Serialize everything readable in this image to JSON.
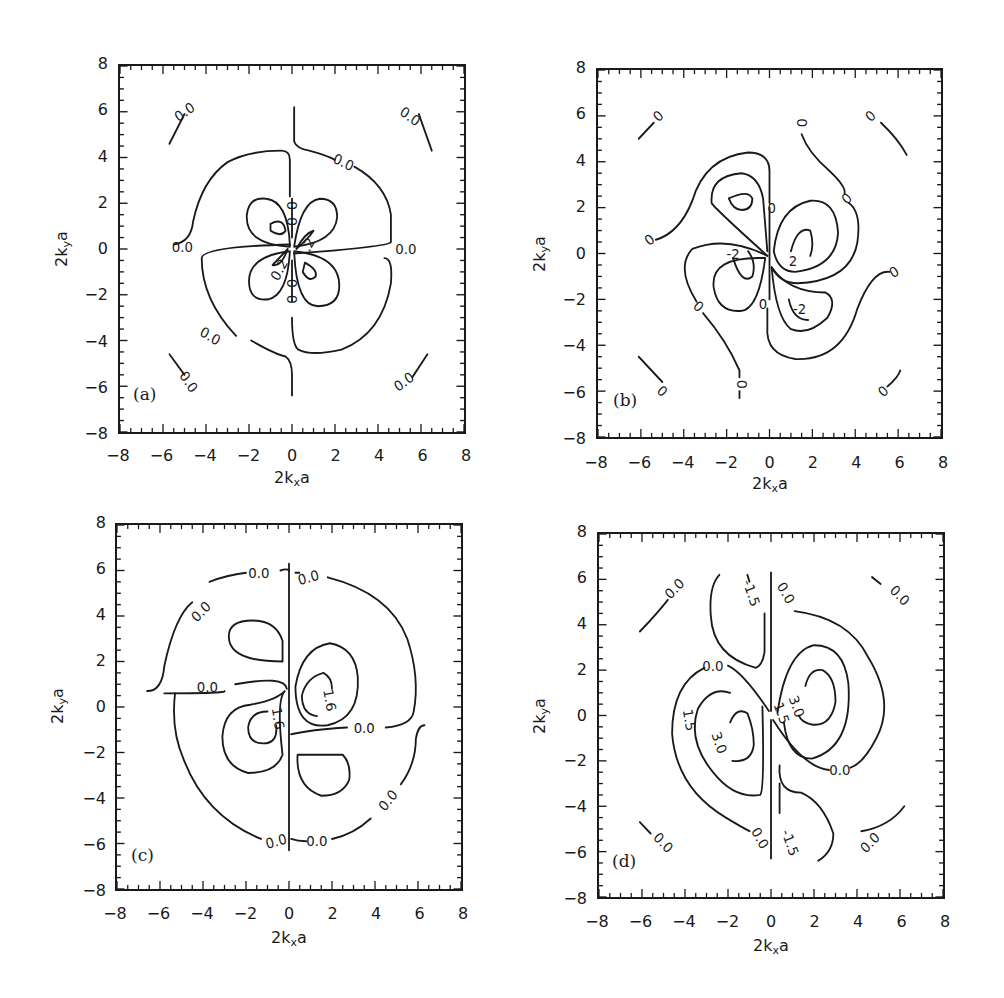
{
  "figure": {
    "axis": {
      "xlabel_main": "2k",
      "xlabel_sub": "x",
      "xlabel_tail": "a",
      "ylabel_main": "2k",
      "ylabel_sub": "y",
      "ylabel_tail": "a",
      "ticks": [
        "-8",
        "-6",
        "-4",
        "-2",
        "0",
        "2",
        "4",
        "6",
        "8"
      ]
    },
    "line_color": "#1a1a1a",
    "background": "#ffffff"
  },
  "chart_data": [
    {
      "type": "contour",
      "panel": "(a)",
      "title": "",
      "xlabel": "2k_x a",
      "ylabel": "2k_y a",
      "xlim": [
        -8,
        8
      ],
      "ylim": [
        -8,
        8
      ],
      "xticks": [
        -8,
        -6,
        -4,
        -2,
        0,
        2,
        4,
        6,
        8
      ],
      "yticks": [
        -8,
        -6,
        -4,
        -2,
        0,
        2,
        4,
        6,
        8
      ],
      "contour_levels": [
        -0.2,
        0.0,
        0.2
      ],
      "contour_labels": [
        {
          "text": "0.0",
          "x": -5.0,
          "y": 6.0,
          "angle": -35
        },
        {
          "text": "0.0",
          "x": 5.5,
          "y": 5.8,
          "angle": 35
        },
        {
          "text": "0.0",
          "x": 2.4,
          "y": 3.8,
          "angle": 25
        },
        {
          "text": "0.0",
          "x": -5.1,
          "y": 0.1,
          "angle": 0
        },
        {
          "text": "0.0",
          "x": 5.3,
          "y": 0.0,
          "angle": 0
        },
        {
          "text": "0.0",
          "x": -3.8,
          "y": -3.8,
          "angle": 30
        },
        {
          "text": "0.0",
          "x": -4.8,
          "y": -5.8,
          "angle": 55
        },
        {
          "text": "0.0",
          "x": 5.2,
          "y": -5.8,
          "angle": -35
        },
        {
          "text": "0",
          "x": 0.0,
          "y": 1.9,
          "angle": 90
        },
        {
          "text": "0",
          "x": 0.0,
          "y": 1.2,
          "angle": 90
        },
        {
          "text": "0",
          "x": 0.0,
          "y": -1.5,
          "angle": 90
        },
        {
          "text": "0",
          "x": 0.0,
          "y": -2.2,
          "angle": 90
        },
        {
          "text": ".2",
          "x": 0.75,
          "y": 0.2,
          "angle": -60
        },
        {
          "text": "0.2",
          "x": -0.6,
          "y": -0.9,
          "angle": -60
        }
      ],
      "curves": [
        {
          "d": "M -5.7 4.6 L -5.0 5.9"
        },
        {
          "d": "M 5.9 5.9 L 6.5 4.3"
        },
        {
          "d": "M -5.7 -4.6 L -5.0 -5.5"
        },
        {
          "d": "M 5.6 -5.6 L 6.3 -4.6"
        },
        {
          "d": "M 0.1 6.2 L 0.1 4.7 Q 0.2 4.4 0.8 4.3 Q 1.6 4.1 2.0 3.9"
        },
        {
          "d": "M 2.9 3.6 Q 4.4 2.8 4.6 1.5 L 4.6 0.3 Q 4.5 0.1 0.1 -0.2"
        },
        {
          "d": "M -0.1 0.2 Q -4.2 0.1 -4.2 -0.4 Q -4.2 -2.2 -2.6 -3.8"
        },
        {
          "d": "M -5.5 0.2 Q -4.7 0.3 -4.6 1.2 Q -4.2 3.0 -3.0 3.8 Q -2.0 4.3 -0.5 4.3 Q -0.1 4.3 -0.1 3.9 L -0.1 2.3"
        },
        {
          "d": "M 4.3 -0.4 Q 4.7 -0.4 4.6 -1.5 Q 4.2 -3.7 2.3 -4.4 Q 0.9 -4.7 0.3 -4.4 Q 0.0 -4.2 0.0 -3.0"
        },
        {
          "d": "M -1.9 -4.0 Q -0.8 -4.6 -0.3 -4.7 Q 0.0 -4.9 0.0 -5.5 L 0.0 -6.4"
        },
        {
          "d": "M -0.1 0.1 Q -2.2 0.2 -2.1 1.5 Q -2.0 2.3 -1.2 2.2 Q -0.2 2.1 -0.1 0.2 Z"
        },
        {
          "d": "M 0.1 0.1 Q 0.4 2.1 1.3 2.2 Q 2.1 2.2 2.1 1.4 Q 2.0 0.3 0.1 0.1 Z"
        },
        {
          "d": "M -0.1 -0.1 Q -2.0 -0.3 -2.0 -1.4 Q -2.0 -2.3 -1.1 -2.2 Q -0.2 -2.0 -0.1 -0.1 Z"
        },
        {
          "d": "M 0.1 -0.1 Q 2.2 -0.3 2.2 -1.6 Q 2.2 -2.5 1.2 -2.5 Q 0.2 -2.5 0.1 -0.1 Z"
        },
        {
          "d": "M -1.0 1.1 Q -0.4 1.4 -0.3 0.8 Q -0.5 0.5 -1.0 0.8 Z"
        },
        {
          "d": "M 0.6 -0.6 Q 1.2 -0.9 1.1 -1.2 Q 0.8 -1.5 0.5 -1.0 Z"
        },
        {
          "d": "M 0.2 0.0 Q 0.8 0.5 1.0 0.8 Q 0.6 0.7 0.2 0.0"
        },
        {
          "d": "M -0.2 0.0 Q -0.7 -0.5 -0.9 -0.7 Q -0.5 -0.8 -0.2 0.0"
        },
        {
          "d": "M 0.0 2.2 L 0.0 0.5 M 0.0 -0.5 L 0.0 -2.3"
        }
      ]
    },
    {
      "type": "contour",
      "panel": "(b)",
      "title": "",
      "xlabel": "2k_x a",
      "ylabel": "2k_y a",
      "xlim": [
        -8,
        8
      ],
      "ylim": [
        -8,
        8
      ],
      "xticks": [
        -8,
        -6,
        -4,
        -2,
        0,
        2,
        4,
        6,
        8
      ],
      "yticks": [
        -8,
        -6,
        -4,
        -2,
        0,
        2,
        4,
        6,
        8
      ],
      "contour_levels": [
        -2,
        0,
        2
      ],
      "contour_labels": [
        {
          "text": "0",
          "x": -5.2,
          "y": 6.0,
          "angle": -45
        },
        {
          "text": "0",
          "x": 1.5,
          "y": 5.7,
          "angle": 90
        },
        {
          "text": "0",
          "x": 4.7,
          "y": 6.0,
          "angle": -45
        },
        {
          "text": "0",
          "x": -5.6,
          "y": 0.6,
          "angle": -40
        },
        {
          "text": "0",
          "x": 3.6,
          "y": 2.4,
          "angle": -45
        },
        {
          "text": "0",
          "x": 0.1,
          "y": 2.0,
          "angle": 0
        },
        {
          "text": "0",
          "x": 5.8,
          "y": -0.8,
          "angle": -35
        },
        {
          "text": "0",
          "x": -3.3,
          "y": -2.3,
          "angle": 45
        },
        {
          "text": "0",
          "x": -0.3,
          "y": -2.2,
          "angle": 0
        },
        {
          "text": "0",
          "x": -1.3,
          "y": -5.7,
          "angle": 90
        },
        {
          "text": "0",
          "x": -5.0,
          "y": -6.0,
          "angle": 45
        },
        {
          "text": "0",
          "x": 5.3,
          "y": -6.0,
          "angle": -45
        },
        {
          "text": "-2",
          "x": -1.7,
          "y": 0.0,
          "angle": 0
        },
        {
          "text": "2",
          "x": 1.1,
          "y": -0.3,
          "angle": 0
        },
        {
          "text": "-2",
          "x": 1.4,
          "y": -2.4,
          "angle": 0
        }
      ],
      "curves": [
        {
          "d": "M -6.1 5.0 L -5.4 5.7"
        },
        {
          "d": "M 5.2 5.7 Q 6.0 5.0 6.4 4.3"
        },
        {
          "d": "M -6.1 -4.5 Q -5.4 -5.2 -5.0 -5.6"
        },
        {
          "d": "M 5.5 -5.8 Q 6.0 -5.4 6.1 -5.1"
        },
        {
          "d": "M 1.5 5.2 Q 1.8 4.4 2.8 3.6 Q 3.6 2.9 3.5 2.6"
        },
        {
          "d": "M 3.7 2.2 Q 4.3 1.8 4.1 0.5 Q 3.8 -1.2 1.3 -1.3 Q 0.5 -1.3 0.1 -0.6"
        },
        {
          "d": "M -5.3 0.6 Q -4.2 0.9 -3.6 2.3 Q -3.0 4.2 -1.0 4.4 Q 0.0 4.4 0.0 3.6 L 0.0 2.2"
        },
        {
          "d": "M -0.1 -0.1 Q -2.0 0.8 -3.6 0.2 Q -4.4 -0.6 -3.4 -2.1"
        },
        {
          "d": "M -3.1 -2.6 Q -2.0 -3.8 -1.4 -5.1 L -1.4 -5.4"
        },
        {
          "d": "M -1.4 -6.0 L -1.4 -6.3"
        },
        {
          "d": "M 5.6 -0.8 Q 4.8 -0.7 4.1 -2.4 Q 3.4 -4.7 1.2 -4.6 Q -0.2 -4.4 -0.1 -3.2 L -0.1 -2.4"
        },
        {
          "d": "M -0.1 -0.1 Q -2.6 2.0 -2.7 2.2 Q -2.8 3.4 -1.3 3.5 Q -0.5 3.4 -0.3 2.4 L -0.1 0.1"
        },
        {
          "d": "M -1.9 2.4 Q -1.0 2.8 -0.8 2.4 Q -0.8 1.9 -1.3 1.9 Q -1.7 1.9 -1.9 2.4 Z"
        },
        {
          "d": "M 0.2 0.1 Q 0.4 2.0 1.9 2.3 Q 3.1 2.4 3.2 0.9 Q 3.1 -0.6 1.2 -0.8 Q 0.4 -0.8 0.2 0.1"
        },
        {
          "d": "M 1.0 0.1 Q 1.3 1.2 1.9 1.0 Q 2.1 0.4 1.9 -0.1"
        },
        {
          "d": "M -0.2 -0.2 Q -2.8 -0.1 -2.6 -1.5 Q -2.4 -2.6 -1.3 -2.5 Q -0.5 -2.4 -0.2 -0.2"
        },
        {
          "d": "M -1.7 -0.2 Q -1.3 -1.4 -0.8 -1.0 Q -0.6 -0.4 -1.0 0.1"
        },
        {
          "d": "M 0.1 -0.6 Q 0.9 -1.7 2.6 -1.7 Q 3.2 -2.0 2.7 -2.8 Q 1.8 -3.6 1.0 -3.3 Q 0.3 -2.8 0.1 -0.6"
        },
        {
          "d": "M 0.9 -2.0 Q 1.1 -2.9 1.8 -2.9"
        },
        {
          "d": "M 0.0 2.0 L 0.0 -2.0"
        }
      ]
    },
    {
      "type": "contour",
      "panel": "(c)",
      "title": "",
      "xlabel": "2k_x a",
      "ylabel": "2k_y a",
      "xlim": [
        -8,
        8
      ],
      "ylim": [
        -8,
        8
      ],
      "xticks": [
        -8,
        -6,
        -4,
        -2,
        0,
        2,
        4,
        6,
        8
      ],
      "yticks": [
        -8,
        -6,
        -4,
        -2,
        0,
        2,
        4,
        6,
        8
      ],
      "contour_levels": [
        -1.6,
        0.0,
        1.6
      ],
      "contour_labels": [
        {
          "text": "0.0",
          "x": -1.4,
          "y": 5.9,
          "angle": 0
        },
        {
          "text": "0.0",
          "x": 0.9,
          "y": 5.7,
          "angle": -15
        },
        {
          "text": "0.0",
          "x": -4.1,
          "y": 4.2,
          "angle": -45
        },
        {
          "text": "0.0",
          "x": -3.8,
          "y": 0.9,
          "angle": 0
        },
        {
          "text": "1.6",
          "x": 1.9,
          "y": 0.3,
          "angle": 80
        },
        {
          "text": "1.6",
          "x": -0.5,
          "y": -0.5,
          "angle": 80
        },
        {
          "text": "0.0",
          "x": 3.5,
          "y": -0.9,
          "angle": 0
        },
        {
          "text": "0.0",
          "x": 4.6,
          "y": -4.1,
          "angle": -50
        },
        {
          "text": "0.0",
          "x": -0.6,
          "y": -5.9,
          "angle": -15
        },
        {
          "text": "0.0",
          "x": 1.3,
          "y": -5.9,
          "angle": 0
        }
      ],
      "curves": [
        {
          "d": "M 0.0 6.3 L 0.0 -6.3"
        },
        {
          "d": "M -0.4 6.0 Q -0.1 6.1 0.0 6.0 M 0.3 5.9 Q 0.6 5.9 0.4 5.9"
        },
        {
          "d": "M -2.0 5.9 Q -2.9 5.8 -3.7 5.5"
        },
        {
          "d": "M 1.8 5.7 Q 4.7 5.0 5.5 3.0 Q 6.1 1.3 5.8 -0.2 Q 5.7 -0.8 4.5 -0.9"
        },
        {
          "d": "M -4.5 4.6 Q -5.3 4.0 -5.8 1.8 Q -5.9 0.7 -6.6 0.7"
        },
        {
          "d": "M -5.8 0.6 Q -2.9 0.6 -3.0 0.7"
        },
        {
          "d": "M -2.5 1.0 Q -0.2 1.4 -0.1 0.8"
        },
        {
          "d": "M -5.3 0.6 Q -5.5 -1.0 -4.9 -2.3 Q -3.9 -4.8 -1.3 -5.8"
        },
        {
          "d": "M 0.8 -5.9 Q 0.4 -5.9 0.1 -5.8"
        },
        {
          "d": "M 2.0 -5.8 Q 3.0 -5.6 3.8 -4.9"
        },
        {
          "d": "M 5.2 -3.4 Q 5.9 -2.5 5.9 -1.4 Q 6.0 -0.8 6.3 -0.8"
        },
        {
          "d": "M 2.7 -0.9 Q 1.0 -1.0 0.1 -1.2"
        },
        {
          "d": "M -2.8 3.1 Q -2.8 2.0 -0.3 2.0 L -0.3 2.9 Q -0.6 3.8 -1.7 3.8 Q -2.8 3.8 -2.8 3.1 Z"
        },
        {
          "d": "M 0.4 -2.1 L 2.5 -2.1 Q 2.9 -2.5 2.8 -3.2 Q 2.5 -3.9 1.5 -3.9 Q 0.3 -3.5 0.4 -2.1 Z"
        },
        {
          "d": "M 0.3 0.9 Q 0.6 2.6 1.9 2.8 Q 3.1 2.6 3.2 1.3 Q 3.3 -0.5 1.8 -0.8 Q 0.3 -1.0 0.3 0.9 Z"
        },
        {
          "d": "M 1.3 -0.4 Q 0.6 -0.3 0.6 0.5 Q 0.8 1.3 1.6 1.5 Q 2.0 1.3 2.0 0.8"
        },
        {
          "d": "M -0.2 0.7 Q -0.6 0.3 -0.3 -2.1 Q -0.6 -2.9 -1.9 -2.9 Q -3.1 -2.6 -3.1 -1.3 Q -3.0 0.0 -1.8 0.1 Q -0.6 0.3 -0.2 0.7"
        },
        {
          "d": "M -0.6 -0.8 Q -0.5 -1.6 -1.2 -1.6 Q -1.9 -1.6 -1.9 -0.9 Q -1.8 -0.2 -1.0 -0.2"
        }
      ]
    },
    {
      "type": "contour",
      "panel": "(d)",
      "title": "",
      "xlabel": "2k_x a",
      "ylabel": "2k_y a",
      "xlim": [
        -8,
        8
      ],
      "ylim": [
        -8,
        8
      ],
      "xticks": [
        -8,
        -6,
        -4,
        -2,
        0,
        2,
        4,
        6,
        8
      ],
      "yticks": [
        -8,
        -6,
        -4,
        -2,
        0,
        2,
        4,
        6,
        8
      ],
      "contour_levels": [
        -1.5,
        0.0,
        1.5,
        3.0
      ],
      "contour_labels": [
        {
          "text": "0.0",
          "x": -4.5,
          "y": 5.6,
          "angle": -45
        },
        {
          "text": "-1.5",
          "x": -0.9,
          "y": 5.4,
          "angle": 70
        },
        {
          "text": "0.0",
          "x": 0.7,
          "y": 5.4,
          "angle": 60
        },
        {
          "text": "0.0",
          "x": 6.0,
          "y": 5.3,
          "angle": 45
        },
        {
          "text": "0.0",
          "x": -2.7,
          "y": 2.2,
          "angle": 0
        },
        {
          "text": "3.0",
          "x": 1.2,
          "y": 0.4,
          "angle": 70
        },
        {
          "text": "1.5",
          "x": 0.5,
          "y": 0.1,
          "angle": 70
        },
        {
          "text": "1.5",
          "x": -3.8,
          "y": -0.2,
          "angle": 80
        },
        {
          "text": "3.0",
          "x": -2.4,
          "y": -1.2,
          "angle": 70
        },
        {
          "text": "0.0",
          "x": 3.2,
          "y": -2.4,
          "angle": 0
        },
        {
          "text": "0.0",
          "x": -0.5,
          "y": -5.4,
          "angle": 60
        },
        {
          "text": "-1.5",
          "x": 0.9,
          "y": -5.6,
          "angle": 70
        },
        {
          "text": "0.0",
          "x": -5.0,
          "y": -5.6,
          "angle": 45
        },
        {
          "text": "0.0",
          "x": 4.6,
          "y": -5.6,
          "angle": -45
        }
      ],
      "curves": [
        {
          "d": "M 0.0 6.3 L 0.0 0.2 M 0.0 -0.2 L 0.0 -6.3"
        },
        {
          "d": "M -6.1 3.7 Q -5.2 4.6 -4.8 5.1"
        },
        {
          "d": "M 4.7 6.1 L 5.1 5.8"
        },
        {
          "d": "M -6.1 -4.7 L -5.6 -5.2"
        },
        {
          "d": "M 4.2 -5.1 Q 5.5 -4.9 6.2 -4.0"
        },
        {
          "d": "M -2.4 6.2 Q -2.9 5.7 -2.8 4.4 Q -2.7 2.6 -0.7 2.1 Q -0.4 2.2 -0.3 2.8 L -0.3 4.5"
        },
        {
          "d": "M -1.1 6.2 L -1.0 5.9"
        },
        {
          "d": "M 0.4 -2.2 Q 0.3 -3.4 1.4 -3.4 Q 2.4 -3.8 2.9 -5.2 Q 2.9 -6.0 2.2 -6.4"
        },
        {
          "d": "M 0.4 -4.3 L 0.4 -3.0"
        },
        {
          "d": "M 1.1 4.6 Q 3.6 4.3 4.5 2.6 Q 5.8 0.6 4.9 -1.0 Q 4.3 -2.1 3.7 -2.3"
        },
        {
          "d": "M 2.7 -2.4 Q 1.5 -2.3 0.1 -0.2"
        },
        {
          "d": "M -0.1 0.2 Q -1.3 1.9 -2.0 2.2"
        },
        {
          "d": "M -3.1 2.1 Q -4.6 1.4 -4.6 -0.8 Q -4.4 -3.2 -2.1 -4.5 Q -1.4 -4.9 -1.0 -5.1"
        },
        {
          "d": "M 0.3 0.1 Q 0.7 2.8 2.0 3.1 Q 3.4 3.1 3.6 1.4 Q 3.8 -1.4 1.9 -1.9 Q 0.8 -1.9 0.6 -0.3"
        },
        {
          "d": "M 1.6 1.3 Q 1.8 2.1 2.4 2.0 Q 3.0 1.7 3.0 0.6 Q 2.8 -0.5 1.9 -0.4 Q 1.4 -0.3 1.3 0.0"
        },
        {
          "d": "M -0.4 0.4 Q -0.3 -3.3 -0.5 -3.5 Q -1.7 -3.7 -2.7 -2.5 Q -3.9 -1.1 -3.4 0.3 Q -2.8 1.3 -1.9 1.0"
        },
        {
          "d": "M -1.9 -0.3 Q -1.6 0.4 -1.1 0.1 Q -0.8 -0.6 -0.8 -1.3 Q -0.9 -2.1 -1.8 -2.0"
        }
      ]
    }
  ],
  "panels": [
    {
      "tag": "(a)"
    },
    {
      "tag": "(b)"
    },
    {
      "tag": "(c)"
    },
    {
      "tag": "(d)"
    }
  ]
}
